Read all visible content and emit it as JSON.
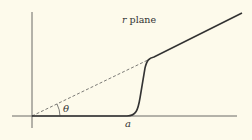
{
  "title": "r plane",
  "labels": {
    "angle": "θ",
    "point": "a"
  },
  "colors": {
    "background": "#fdfaeb",
    "ink": "#333333"
  }
}
